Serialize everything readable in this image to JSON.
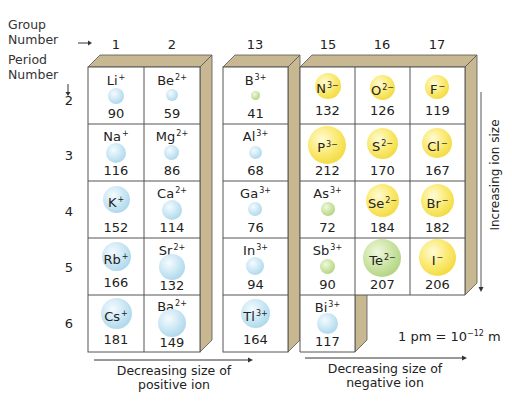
{
  "header": {
    "group_label_line1": "Group",
    "group_label_line2": "Number",
    "period_label_line1": "Period",
    "period_label_line2": "Number"
  },
  "groups": [
    "1",
    "2",
    "13",
    "15",
    "16",
    "17"
  ],
  "periods": [
    "2",
    "3",
    "4",
    "5",
    "6"
  ],
  "colors": {
    "cation": "#a9d6ea",
    "anion": "#f2d93a",
    "neutral_green": "#aed27f",
    "box_side": "#c8b892",
    "grid_line": "#555555"
  },
  "cells": [
    {
      "symbol": "Li",
      "charge": "+",
      "radius": "90",
      "group": "1",
      "period": "2",
      "type": "cation"
    },
    {
      "symbol": "Be",
      "charge": "2+",
      "radius": "59",
      "group": "2",
      "period": "2",
      "type": "cation"
    },
    {
      "symbol": "B",
      "charge": "3+",
      "radius": "41",
      "group": "13",
      "period": "2",
      "type": "green"
    },
    {
      "symbol": "N",
      "charge": "3−",
      "radius": "132",
      "group": "15",
      "period": "2",
      "type": "anion"
    },
    {
      "symbol": "O",
      "charge": "2−",
      "radius": "126",
      "group": "16",
      "period": "2",
      "type": "anion"
    },
    {
      "symbol": "F",
      "charge": "−",
      "radius": "119",
      "group": "17",
      "period": "2",
      "type": "anion"
    },
    {
      "symbol": "Na",
      "charge": "+",
      "radius": "116",
      "group": "1",
      "period": "3",
      "type": "cation"
    },
    {
      "symbol": "Mg",
      "charge": "2+",
      "radius": "86",
      "group": "2",
      "period": "3",
      "type": "cation"
    },
    {
      "symbol": "Al",
      "charge": "3+",
      "radius": "68",
      "group": "13",
      "period": "3",
      "type": "cation"
    },
    {
      "symbol": "P",
      "charge": "3−",
      "radius": "212",
      "group": "15",
      "period": "3",
      "type": "anion"
    },
    {
      "symbol": "S",
      "charge": "2−",
      "radius": "170",
      "group": "16",
      "period": "3",
      "type": "anion"
    },
    {
      "symbol": "Cl",
      "charge": "−",
      "radius": "167",
      "group": "17",
      "period": "3",
      "type": "anion"
    },
    {
      "symbol": "K",
      "charge": "+",
      "radius": "152",
      "group": "1",
      "period": "4",
      "type": "cation"
    },
    {
      "symbol": "Ca",
      "charge": "2+",
      "radius": "114",
      "group": "2",
      "period": "4",
      "type": "cation"
    },
    {
      "symbol": "Ga",
      "charge": "3+",
      "radius": "76",
      "group": "13",
      "period": "4",
      "type": "cation"
    },
    {
      "symbol": "As",
      "charge": "3+",
      "radius": "72",
      "group": "15",
      "period": "4",
      "type": "green"
    },
    {
      "symbol": "Se",
      "charge": "2−",
      "radius": "184",
      "group": "16",
      "period": "4",
      "type": "anion"
    },
    {
      "symbol": "Br",
      "charge": "−",
      "radius": "182",
      "group": "17",
      "period": "4",
      "type": "anion"
    },
    {
      "symbol": "Rb",
      "charge": "+",
      "radius": "166",
      "group": "1",
      "period": "5",
      "type": "cation"
    },
    {
      "symbol": "Sr",
      "charge": "2+",
      "radius": "132",
      "group": "2",
      "period": "5",
      "type": "cation"
    },
    {
      "symbol": "In",
      "charge": "3+",
      "radius": "94",
      "group": "13",
      "period": "5",
      "type": "cation"
    },
    {
      "symbol": "Sb",
      "charge": "3+",
      "radius": "90",
      "group": "15",
      "period": "5",
      "type": "green"
    },
    {
      "symbol": "Te",
      "charge": "2−",
      "radius": "207",
      "group": "16",
      "period": "5",
      "type": "green"
    },
    {
      "symbol": "I",
      "charge": "−",
      "radius": "206",
      "group": "17",
      "period": "5",
      "type": "anion"
    },
    {
      "symbol": "Cs",
      "charge": "+",
      "radius": "181",
      "group": "1",
      "period": "6",
      "type": "cation"
    },
    {
      "symbol": "Ba",
      "charge": "2+",
      "radius": "149",
      "group": "2",
      "period": "6",
      "type": "cation"
    },
    {
      "symbol": "Tl",
      "charge": "3+",
      "radius": "164",
      "group": "13",
      "period": "6",
      "type": "cation"
    },
    {
      "symbol": "Bi",
      "charge": "3+",
      "radius": "117",
      "group": "15",
      "period": "6",
      "type": "cation"
    }
  ],
  "captions": {
    "positive_line1": "Decreasing size of",
    "positive_line2": "positive ion",
    "negative_line1": "Decreasing size of",
    "negative_line2": "negative ion",
    "vertical": "Increasing ion size",
    "unit_prefix": "1 pm = 10",
    "unit_exp": "−12",
    "unit_suffix": " m"
  }
}
